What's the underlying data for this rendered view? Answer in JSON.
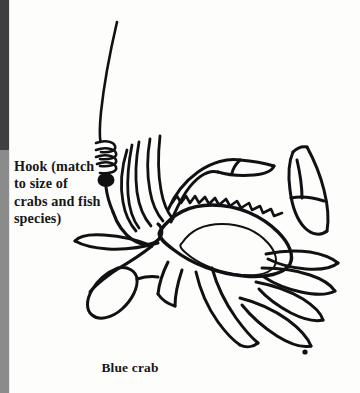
{
  "figure": {
    "background_color": "#fdfdfc",
    "ink_color": "#111114"
  },
  "gutter": {
    "top_color": "#3f3f42",
    "bottom_color": "#8b8b8c",
    "split_y": 150
  },
  "annotation": {
    "lines": [
      "Hook (match",
      "to size of",
      "crabs and fish",
      "species)"
    ]
  },
  "caption": {
    "text": "Blue crab"
  }
}
